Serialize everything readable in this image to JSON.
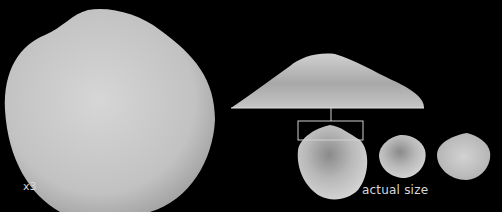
{
  "figure": {
    "background": "#000000",
    "shell_color": "#c8c8c8",
    "magnification_label": "x3",
    "actual_size_label": "actual size",
    "specimens": [
      {
        "name": "enlarged-shell",
        "view": "x3 magnified"
      },
      {
        "name": "hinge-detail",
        "view": "enlarged umbo detail"
      },
      {
        "name": "actual-shell-1",
        "view": "actual size, with detail box"
      },
      {
        "name": "actual-shell-2",
        "view": "actual size"
      },
      {
        "name": "actual-shell-3",
        "view": "actual size"
      }
    ]
  }
}
